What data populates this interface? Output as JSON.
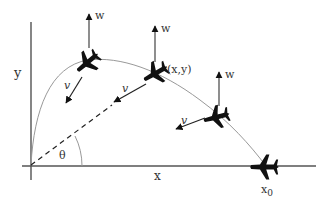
{
  "diagram": {
    "type": "projectile-trajectory",
    "axes": {
      "x_label": "x",
      "y_label": "y",
      "x0_label": "x0",
      "x0_main": "x",
      "x0_sub": "0"
    },
    "angle_label": "θ",
    "point_label": "(x,y)",
    "vectors": {
      "weight_label": "w",
      "velocity_label": "v"
    },
    "planes": [
      {
        "id": "plane-1",
        "w_label": "w",
        "v_label": "v"
      },
      {
        "id": "plane-2",
        "w_label": "w",
        "v_label": "v",
        "point": "(x,y)"
      },
      {
        "id": "plane-3",
        "w_label": "w",
        "v_label": "v"
      },
      {
        "id": "plane-4-landed",
        "x_label": "x0"
      }
    ],
    "colors": {
      "axis": "#444444",
      "curve": "#999999",
      "plane": "#111111",
      "text": "#333333"
    }
  }
}
